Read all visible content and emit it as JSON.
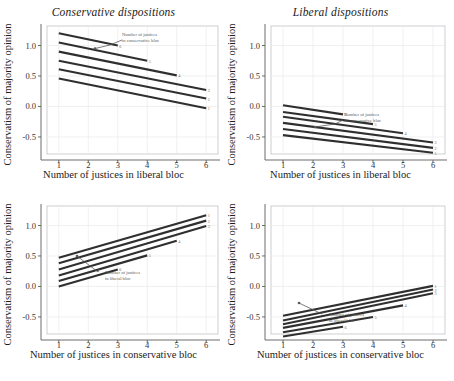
{
  "figure": {
    "y_axis_label": "Conservatism of majority opinion",
    "colors": {
      "line": "#2f2f2f",
      "axis": "#5b5b5b",
      "grid": "#e9e9ee",
      "annotation": "#5a5a5a",
      "background": "#ffffff"
    }
  },
  "chart_data": [
    {
      "id": "top-left",
      "type": "line",
      "title": "Conservative dispositions",
      "xlabel": "Number of justices in liberal bloc",
      "ylabel": "Conservatism of majority opinion",
      "xlim": [
        0.6,
        6.4
      ],
      "ylim": [
        -0.78,
        1.32
      ],
      "xticks": [
        1,
        2,
        3,
        4,
        5,
        6
      ],
      "yticks": [
        -0.5,
        0.0,
        0.5,
        1.0
      ],
      "ytick_labels": [
        "-0.5",
        "0.0",
        "0.5",
        "1.0"
      ],
      "grid": true,
      "legend": "none",
      "annotation": "Number of justices in conservative bloc",
      "annotation_target_series": "6",
      "series": [
        {
          "name": "6",
          "x": [
            1,
            3
          ],
          "values": [
            1.2,
            1.0
          ]
        },
        {
          "name": "5",
          "x": [
            1,
            4
          ],
          "values": [
            1.05,
            0.75
          ]
        },
        {
          "name": "4",
          "x": [
            1,
            5
          ],
          "values": [
            0.9,
            0.51
          ]
        },
        {
          "name": "3",
          "x": [
            1,
            6
          ],
          "values": [
            0.75,
            0.27
          ]
        },
        {
          "name": "2",
          "x": [
            1,
            6
          ],
          "values": [
            0.61,
            0.13
          ]
        },
        {
          "name": "1",
          "x": [
            1,
            6
          ],
          "values": [
            0.46,
            -0.03
          ]
        }
      ]
    },
    {
      "id": "top-right",
      "type": "line",
      "title": "Liberal dispositions",
      "xlabel": "Number of justices in liberal bloc",
      "ylabel": "Conservatism of majority opinion",
      "xlim": [
        0.6,
        6.4
      ],
      "ylim": [
        -0.78,
        1.32
      ],
      "xticks": [
        1,
        2,
        3,
        4,
        5,
        6
      ],
      "yticks": [
        -0.5,
        0.0,
        0.5,
        1.0
      ],
      "ytick_labels": [
        "-0.5",
        "0.0",
        "0.5",
        "1.0"
      ],
      "grid": true,
      "legend": "none",
      "annotation": "Number of justices in conservative bloc",
      "annotation_target_series": "6",
      "series": [
        {
          "name": "6",
          "x": [
            1,
            3
          ],
          "values": [
            0.02,
            -0.13
          ]
        },
        {
          "name": "5",
          "x": [
            1,
            4
          ],
          "values": [
            -0.09,
            -0.29
          ]
        },
        {
          "name": "4",
          "x": [
            1,
            5
          ],
          "values": [
            -0.17,
            -0.44
          ]
        },
        {
          "name": "3",
          "x": [
            1,
            6
          ],
          "values": [
            -0.27,
            -0.59
          ]
        },
        {
          "name": "2",
          "x": [
            1,
            6
          ],
          "values": [
            -0.37,
            -0.68
          ]
        },
        {
          "name": "1",
          "x": [
            1,
            6
          ],
          "values": [
            -0.47,
            -0.76
          ]
        }
      ]
    },
    {
      "id": "bottom-left",
      "type": "line",
      "title": "",
      "xlabel": "Number of justices in conservative bloc",
      "ylabel": "Conservatism of majority opinion",
      "xlim": [
        0.6,
        6.4
      ],
      "ylim": [
        -0.78,
        1.32
      ],
      "xticks": [
        1,
        2,
        3,
        4,
        5,
        6
      ],
      "yticks": [
        -0.5,
        0.0,
        0.5,
        1.0
      ],
      "ytick_labels": [
        "-0.5",
        "0.0",
        "0.5",
        "1.0"
      ],
      "grid": true,
      "legend": "none",
      "annotation": "Number of justices in liberal bloc",
      "annotation_target_series": "6",
      "series": [
        {
          "name": "1",
          "x": [
            1,
            6
          ],
          "values": [
            0.47,
            1.17
          ]
        },
        {
          "name": "2",
          "x": [
            1,
            6
          ],
          "values": [
            0.38,
            1.08
          ]
        },
        {
          "name": "3",
          "x": [
            1,
            6
          ],
          "values": [
            0.28,
            0.99
          ]
        },
        {
          "name": "4",
          "x": [
            1,
            5
          ],
          "values": [
            0.18,
            0.75
          ]
        },
        {
          "name": "5",
          "x": [
            1,
            4
          ],
          "values": [
            0.09,
            0.51
          ]
        },
        {
          "name": "6",
          "x": [
            1,
            3
          ],
          "values": [
            0.0,
            0.28
          ]
        }
      ]
    },
    {
      "id": "bottom-right",
      "type": "line",
      "title": "",
      "xlabel": "Number of justices in conservative bloc",
      "ylabel": "Conservatism of majority opinion",
      "xlim": [
        0.6,
        6.4
      ],
      "ylim": [
        -0.78,
        1.32
      ],
      "xticks": [
        1,
        2,
        3,
        4,
        5,
        6
      ],
      "yticks": [
        -0.5,
        0.0,
        0.5,
        1.0
      ],
      "ytick_labels": [
        "-0.5",
        "0.0",
        "0.5",
        "1.0"
      ],
      "grid": true,
      "legend": "none",
      "annotation": "Number of justices in liberal bloc",
      "annotation_target_series": "6",
      "series": [
        {
          "name": "1",
          "x": [
            1,
            6
          ],
          "values": [
            -0.48,
            0.01
          ]
        },
        {
          "name": "2",
          "x": [
            1,
            6
          ],
          "values": [
            -0.56,
            -0.05
          ]
        },
        {
          "name": "3",
          "x": [
            1,
            6
          ],
          "values": [
            -0.62,
            -0.11
          ]
        },
        {
          "name": "4",
          "x": [
            1,
            5
          ],
          "values": [
            -0.68,
            -0.31
          ]
        },
        {
          "name": "5",
          "x": [
            1,
            4
          ],
          "values": [
            -0.75,
            -0.5
          ]
        },
        {
          "name": "6",
          "x": [
            1,
            3
          ],
          "values": [
            -0.82,
            -0.66
          ]
        }
      ]
    }
  ]
}
